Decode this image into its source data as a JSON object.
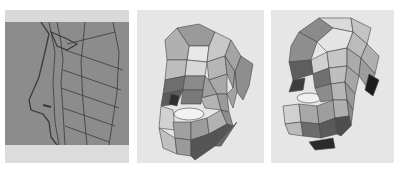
{
  "figure": {
    "panels": [
      {
        "id": "p1",
        "label": "",
        "description": "wireframe side profile over reference image",
        "bg": "#8c8c8c"
      },
      {
        "id": "p2",
        "label": "",
        "description": "shaded low-poly head mesh, front-left view",
        "bg": "#e6e6e6"
      },
      {
        "id": "p3",
        "label": "",
        "description": "shaded low-poly head mesh, left three-quarter view",
        "bg": "#e6e6e6"
      }
    ]
  },
  "colors": {
    "panel_bg": "#e6e6e6",
    "viewport_gray": "#8c8c8c",
    "wire": "#3a3a3a",
    "mesh_edge": "#444444"
  }
}
